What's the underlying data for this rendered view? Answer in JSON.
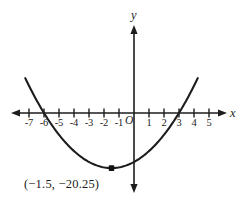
{
  "figure": {
    "background_color": "#ffffff",
    "ink_color": "#1d1d1d",
    "width": 245,
    "height": 202
  },
  "axes": {
    "x_axis_label": "x",
    "y_axis_label": "y",
    "origin_label": "O",
    "x_tick_labels": [
      "-7",
      "-6",
      "-5",
      "-4",
      "-3",
      "-2",
      "-1",
      "1",
      "2",
      "3",
      "4",
      "5"
    ],
    "y_tick_labels": []
  },
  "annotations": {
    "vertex_label": "(−1.5, −20.25)"
  },
  "chart_data": {
    "type": "line",
    "title": "",
    "xlabel": "x",
    "ylabel": "y",
    "grid": false,
    "legend": false,
    "xlim": [
      -8,
      6
    ],
    "ylim": [
      -24,
      14
    ],
    "xticks": [
      -7,
      -6,
      -5,
      -4,
      -3,
      -2,
      -1,
      1,
      2,
      3,
      4,
      5
    ],
    "xtick_labels": [
      "-7",
      "-6",
      "-5",
      "-4",
      "-3",
      "-2",
      "-1",
      "1",
      "2",
      "3",
      "4",
      "5"
    ],
    "yticks": [],
    "series": [
      {
        "name": "y = x^2 + 3x - 18",
        "type": "parabola",
        "a": 1,
        "b": 3,
        "c": -18,
        "vertex": [
          -1.5,
          -20.25
        ],
        "roots": [
          -6,
          3
        ],
        "y_intercept": -18,
        "x": [
          -7.2,
          -7,
          -6.5,
          -6,
          -5.5,
          -5,
          -4.5,
          -4,
          -3.5,
          -3,
          -2.5,
          -2,
          -1.5,
          -1,
          -0.5,
          0,
          0.5,
          1,
          1.5,
          2,
          2.5,
          3,
          3.5,
          4,
          4.3
        ],
        "values": [
          8.64,
          2,
          -7.25,
          -18,
          -20.75,
          -22,
          -22.25,
          -22,
          -21.25,
          -20,
          -18.75,
          -17,
          -20.25,
          -20,
          -19.25,
          -18,
          -16.25,
          -14,
          -11.25,
          -8,
          -4.25,
          0,
          4.75,
          10,
          13.39
        ]
      }
    ],
    "points": [
      {
        "label": "(−1.5, −20.25)",
        "x": -1.5,
        "y": -20.25,
        "marker": "filled-square"
      }
    ]
  }
}
